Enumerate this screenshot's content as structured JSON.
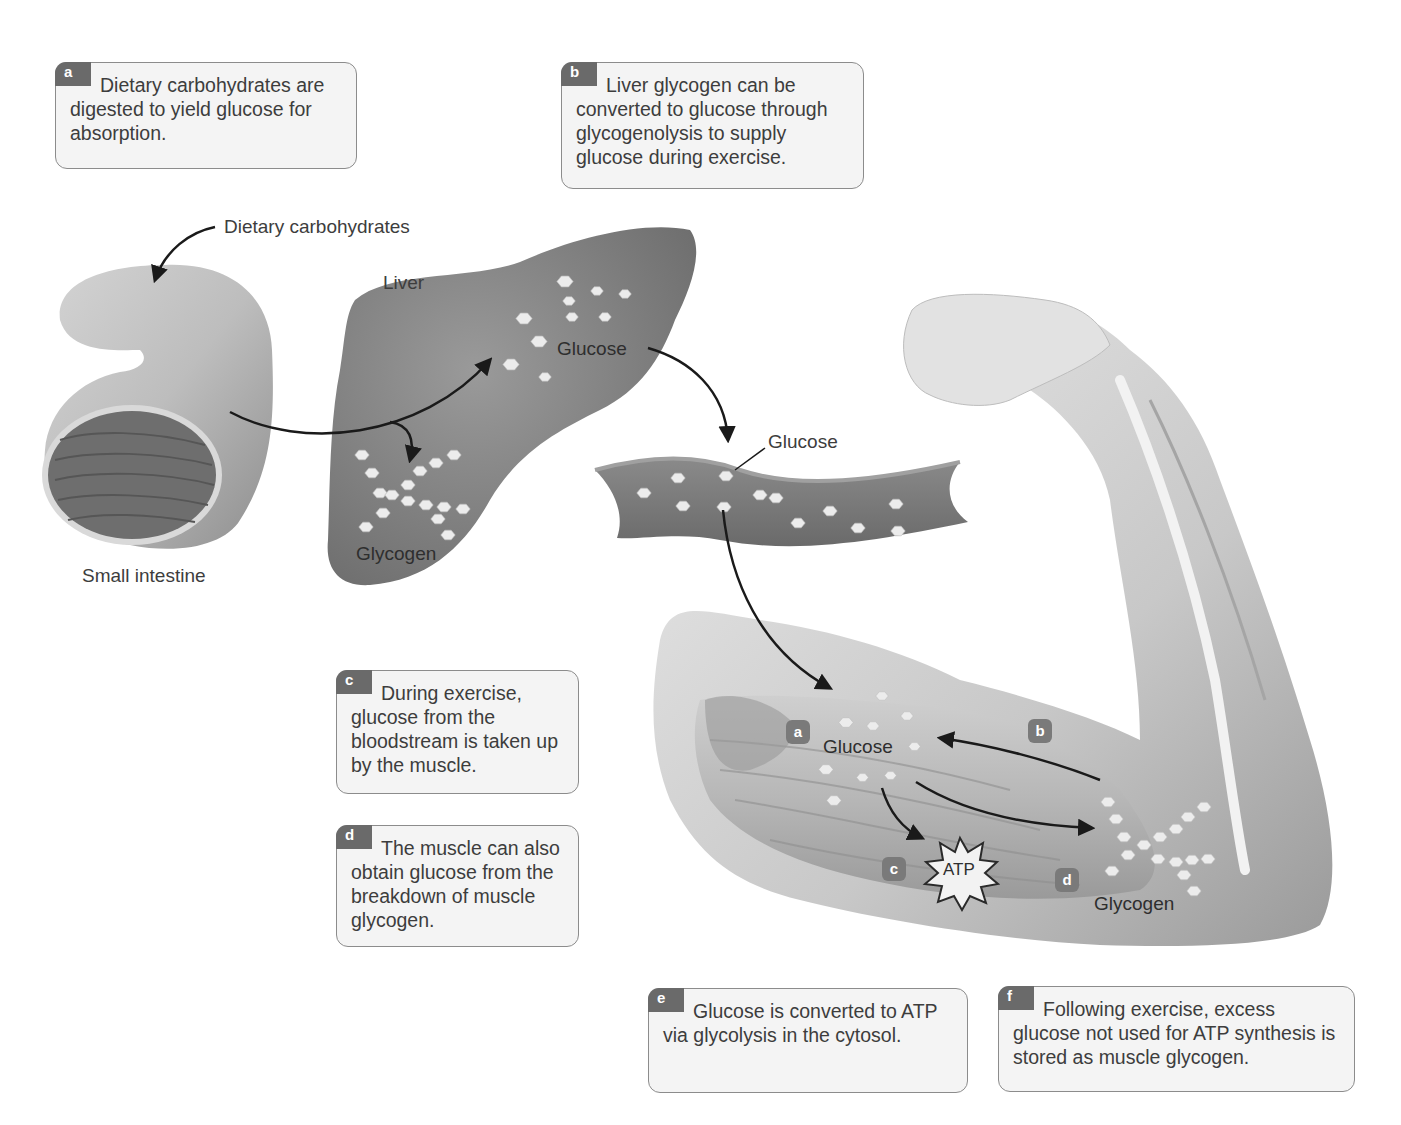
{
  "figure": {
    "colors": {
      "callout_bg": "#f4f4f4",
      "callout_border": "#8c8c8c",
      "badge_bg": "#6a6a6a",
      "organ_gray": "#7d7d7d",
      "molecule": "#e8e8e8",
      "arrow": "#1a1a1a"
    }
  },
  "callouts": [
    {
      "id": "a",
      "badge": "a",
      "text": "Dietary carbohydrates are digested to yield glucose for absorption."
    },
    {
      "id": "b",
      "badge": "b",
      "text": "Liver glycogen can be converted to glucose through glycogenolysis to supply glucose during exercise."
    },
    {
      "id": "c",
      "badge": "c",
      "text": "During exercise, glucose from the bloodstream is taken up by the muscle."
    },
    {
      "id": "d",
      "badge": "d",
      "text": "The muscle can also obtain glucose from the breakdown of muscle glycogen."
    },
    {
      "id": "e",
      "badge": "e",
      "text": "Glucose is converted to ATP via glycolysis in the cytosol."
    },
    {
      "id": "f",
      "badge": "f",
      "text": "Following exercise, excess glucose not used for ATP synthesis is stored as muscle glycogen."
    }
  ],
  "labels": {
    "dietary_carbohydrates": "Dietary carbohydrates",
    "small_intestine": "Small intestine",
    "liver": "Liver",
    "liver_glucose": "Glucose",
    "liver_glycogen": "Glycogen",
    "blood_glucose": "Glucose",
    "muscle_glucose": "Glucose",
    "muscle_glycogen": "Glycogen",
    "atp": "ATP"
  },
  "muscle_steps": [
    {
      "id": "a",
      "label": "a"
    },
    {
      "id": "b",
      "label": "b"
    },
    {
      "id": "c",
      "label": "c"
    },
    {
      "id": "d",
      "label": "d"
    }
  ],
  "icons": {
    "molecule": "glucose-molecule-icon",
    "atp_burst": "atp-starburst-icon",
    "arrow": "flow-arrow-icon"
  }
}
